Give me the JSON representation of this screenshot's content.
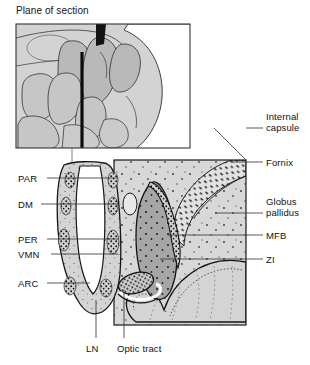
{
  "figure": {
    "title": "Plane of section",
    "kind": "anatomical-diagram",
    "colors": {
      "ink": "#111111",
      "panel_fill": "#d9d9d9",
      "tissue_light": "#d2d2d2",
      "tissue_mid": "#bdbdbd",
      "tissue_dark": "#a2a2a2",
      "inset_fill": "#d0d0d0",
      "white": "#ffffff",
      "section_line": "#111111"
    }
  },
  "inset": {
    "name": "sagittal-plane-inset",
    "caption": "Plane of section",
    "section_line_label": "plane-of-section-line"
  },
  "labels_left": [
    {
      "id": "PAR",
      "text": "PAR",
      "x": 18,
      "y": 173,
      "leader_x1": 47,
      "leader_x2": 118,
      "leader_y": 178
    },
    {
      "id": "DM",
      "text": "DM",
      "x": 18,
      "y": 199,
      "leader_x1": 41,
      "leader_x2": 118,
      "leader_y": 204
    },
    {
      "id": "PER",
      "text": "PER",
      "x": 18,
      "y": 234,
      "leader_x1": 47,
      "leader_x2": 118,
      "leader_y": 239
    },
    {
      "id": "VMN",
      "text": "VMN",
      "x": 18,
      "y": 249,
      "leader_x1": 51,
      "leader_x2": 118,
      "leader_y": 254
    },
    {
      "id": "ARC",
      "text": "ARC",
      "x": 18,
      "y": 278,
      "leader_x1": 47,
      "leader_x2": 90,
      "leader_y": 283
    }
  ],
  "labels_right": [
    {
      "id": "internal-capsule",
      "line1": "Internal",
      "line2": "capsule",
      "x": 266,
      "y": 111,
      "leader_x1": 246,
      "leader_x2": 263,
      "leader_y": 128
    },
    {
      "id": "fornix",
      "line1": "Fornix",
      "line2": "",
      "x": 266,
      "y": 157,
      "leader_x1": 232,
      "leader_x2": 263,
      "leader_y": 162
    },
    {
      "id": "globus-pallidus",
      "line1": "Globus",
      "line2": "pallidus",
      "x": 266,
      "y": 196,
      "leader_x1": 215,
      "leader_x2": 263,
      "leader_y": 213
    },
    {
      "id": "mfb",
      "line1": "MFB",
      "line2": "",
      "x": 266,
      "y": 230,
      "leader_x1": 168,
      "leader_x2": 263,
      "leader_y": 235
    },
    {
      "id": "zi",
      "line1": "ZI",
      "line2": "",
      "x": 266,
      "y": 254,
      "leader_x1": 160,
      "leader_x2": 263,
      "leader_y": 259
    }
  ],
  "labels_bottom": [
    {
      "id": "LN",
      "text": "LN",
      "x": 86,
      "y": 343,
      "leader_x": 96,
      "leader_y1": 300,
      "leader_y2": 338
    },
    {
      "id": "optic-tract",
      "text": "Optic tract",
      "x": 117,
      "y": 343,
      "leader_x": 124,
      "leader_y1": 290,
      "leader_y2": 338
    }
  ]
}
